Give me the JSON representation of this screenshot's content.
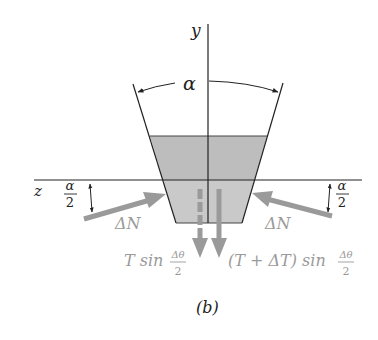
{
  "figure": {
    "caption": "(b)",
    "axes": {
      "y_label": "y",
      "z_label": "z"
    },
    "angle_label": "α",
    "half_angle": {
      "numerator": "α",
      "denominator": "2"
    },
    "normal_force_label": "ΔN",
    "tension_left": {
      "prefix": "T sin",
      "numerator": "Δθ",
      "denominator": "2"
    },
    "tension_right": {
      "prefix": "(T + ΔT) sin",
      "numerator": "Δθ",
      "denominator": "2"
    },
    "colors": {
      "line": "#222222",
      "fill_upper": "#bdbdbd",
      "fill_lower": "#c9c9c9",
      "force_arrow": "#9a9a9a",
      "label_gray": "#9a9a9a",
      "text": "#222222"
    }
  }
}
